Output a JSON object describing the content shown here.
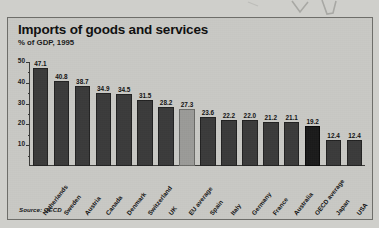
{
  "chart_data": {
    "type": "bar",
    "title": "Imports of goods and services",
    "subtitle": "% of GDP, 1995",
    "xlabel": "",
    "ylabel": "",
    "ylim": [
      0,
      50
    ],
    "yticks": [
      10,
      20,
      30,
      40,
      50
    ],
    "grid": false,
    "legend": "none",
    "source": "Source: OECD",
    "categories": [
      "Netherlands",
      "Sweden",
      "Austria",
      "Canada",
      "Denmark",
      "Switzerland",
      "UK",
      "EU average",
      "Spain",
      "Italy",
      "Germany",
      "France",
      "Australia",
      "OECD average",
      "Japan",
      "USA"
    ],
    "values": [
      47.1,
      40.8,
      38.7,
      34.9,
      34.5,
      31.5,
      28.2,
      27.3,
      23.6,
      22.2,
      22.0,
      21.2,
      21.1,
      19.2,
      12.4,
      12.4
    ],
    "value_labels": [
      "47.1",
      "40.8",
      "38.7",
      "34.9",
      "34.5",
      "31.5",
      "28.2",
      "27.3",
      "23.6",
      "22.2",
      "22.0",
      "21.2",
      "21.1",
      "19.2",
      "12.4",
      "12.4"
    ],
    "bar_styles": [
      "country",
      "country",
      "country",
      "country",
      "country",
      "country",
      "country",
      "average-light",
      "country",
      "country",
      "country",
      "country",
      "country",
      "average-dark",
      "country",
      "country"
    ],
    "colors": {
      "country_bar": "#3b3b3b",
      "average_light_bar": "#9b9b98",
      "average_dark_bar": "#1b1b1b",
      "plot_background": "#c9c9c5",
      "page_background": "#cfcfcb",
      "axis": "#3a3a38",
      "text": "#101010"
    }
  }
}
